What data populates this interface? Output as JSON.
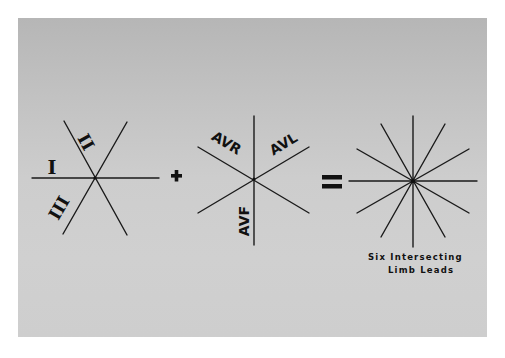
{
  "figure": {
    "background_color": "#c6c6c6",
    "line_color": "#1a1a1a",
    "panels": [
      {
        "id": "bipolar-leads",
        "center": [
          95,
          178
        ],
        "labels": [
          {
            "text": "I",
            "lead": "lead-I"
          },
          {
            "text": "II",
            "lead": "lead-II"
          },
          {
            "text": "III",
            "lead": "lead-III"
          }
        ]
      },
      {
        "id": "augmented-leads",
        "center": [
          254,
          179
        ],
        "labels": [
          {
            "text": "AVR",
            "lead": "lead-aVR"
          },
          {
            "text": "AVL",
            "lead": "lead-aVL"
          },
          {
            "text": "AVF",
            "lead": "lead-aVF"
          }
        ]
      },
      {
        "id": "hexaxial-result",
        "center": [
          413,
          181
        ],
        "line_count": 6
      }
    ],
    "operators": {
      "plus": "+",
      "equals": "="
    },
    "caption": {
      "line1": "Six Intersecting",
      "line2": "Limb Leads"
    }
  }
}
